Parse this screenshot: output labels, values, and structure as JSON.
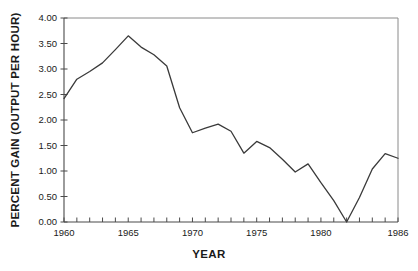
{
  "chart_data": {
    "type": "line",
    "title": "",
    "xlabel": "YEAR",
    "ylabel": "PERCENT GAIN  (OUTPUT PER HOUR)",
    "xlim": [
      1960,
      1986
    ],
    "ylim": [
      0.0,
      4.0
    ],
    "grid": false,
    "legend": "none",
    "x_tick_labels": [
      "1960",
      "1965",
      "1970",
      "1975",
      "1980",
      "1986"
    ],
    "x_tick_label_values": [
      1960,
      1965,
      1970,
      1975,
      1980,
      1986
    ],
    "y_tick_labels": [
      "0.00",
      "0.50",
      "1.00",
      "1.50",
      "2.00",
      "2.50",
      "3.00",
      "3.50",
      "4.00"
    ],
    "y_tick_values": [
      0.0,
      0.5,
      1.0,
      1.5,
      2.0,
      2.5,
      3.0,
      3.5,
      4.0
    ],
    "x": [
      1960,
      1961,
      1962,
      1963,
      1964,
      1965,
      1966,
      1967,
      1968,
      1969,
      1970,
      1971,
      1972,
      1973,
      1974,
      1975,
      1976,
      1977,
      1978,
      1979,
      1980,
      1981,
      1982,
      1983,
      1984,
      1985,
      1986
    ],
    "values": [
      2.42,
      2.8,
      2.95,
      3.12,
      3.38,
      3.65,
      3.43,
      3.28,
      3.06,
      2.24,
      1.75,
      1.84,
      1.92,
      1.78,
      1.35,
      1.58,
      1.46,
      1.23,
      0.98,
      1.14,
      0.77,
      0.42,
      0.0,
      0.48,
      1.04,
      1.34,
      1.25
    ],
    "series": [
      {
        "name": "Percent gain (output per hour)",
        "color": "#3a3a3a",
        "values": [
          2.42,
          2.8,
          2.95,
          3.12,
          3.38,
          3.65,
          3.43,
          3.28,
          3.06,
          2.24,
          1.75,
          1.84,
          1.92,
          1.78,
          1.35,
          1.58,
          1.46,
          1.23,
          0.98,
          1.14,
          0.77,
          0.42,
          0.0,
          0.48,
          1.04,
          1.34,
          1.25
        ]
      }
    ]
  },
  "axis": {
    "x_title": "YEAR",
    "y_title": "PERCENT GAIN  (OUTPUT PER HOUR)"
  }
}
